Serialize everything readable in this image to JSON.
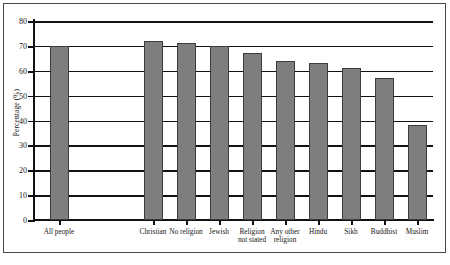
{
  "chart_data": {
    "type": "bar",
    "title": "",
    "xlabel": "",
    "ylabel": "Percentage (%)",
    "ylim": [
      0,
      80
    ],
    "ytick_step": 10,
    "yticks": [
      0,
      10,
      20,
      30,
      40,
      50,
      60,
      70,
      80
    ],
    "ytick_labels": [
      "0",
      "10",
      "20",
      "30",
      "40",
      "50",
      "60",
      "70",
      "80"
    ],
    "grid": true,
    "grid_axis": "y",
    "legend": false,
    "legend_position": "none",
    "bar_color": "#7e7e7e",
    "bar_edge_color": "#3d3d3d",
    "categories": [
      "All people",
      "Christian",
      "No religion",
      "Jewish",
      "Religion not stated",
      "Any other religion",
      "Hindu",
      "Sikh",
      "Buddhist",
      "Muslim"
    ],
    "category_lines": [
      [
        "All people",
        ""
      ],
      [
        "Christian",
        ""
      ],
      [
        "No religion",
        ""
      ],
      [
        "Jewish",
        ""
      ],
      [
        "Religion",
        "not stated"
      ],
      [
        "Any other",
        "religion"
      ],
      [
        "Hindu",
        ""
      ],
      [
        "Sikh",
        ""
      ],
      [
        "Buddhist",
        ""
      ],
      [
        "Muslim",
        ""
      ]
    ],
    "values": [
      70,
      72,
      71,
      70,
      67,
      64,
      63,
      61,
      57,
      38
    ]
  },
  "source_caption": ""
}
